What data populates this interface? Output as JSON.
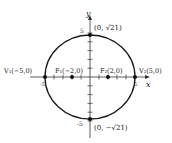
{
  "diagram": {
    "type": "ellipse",
    "axes": {
      "x_label": "x",
      "y_label": "y"
    },
    "ticks": {
      "x_neg": "-5",
      "x_pos": "5",
      "y_pos": "5",
      "y_neg": "-5"
    },
    "points": {
      "v1": {
        "label": "V₁(−5,0)",
        "x": -5,
        "y": 0
      },
      "f1": {
        "label": "F₁(−2,0)",
        "x": -2,
        "y": 0
      },
      "f2": {
        "label": "F₂(2,0)",
        "x": 2,
        "y": 0
      },
      "v2": {
        "label": "V₂(5,0)",
        "x": 5,
        "y": 0
      },
      "top": {
        "label": "(0, √21)",
        "x": 0,
        "y": 4.583
      },
      "bottom": {
        "label": "(0, −√21)",
        "x": 0,
        "y": -4.583
      }
    },
    "colors": {
      "stroke": "#1a1a1a",
      "text": "#222222"
    }
  }
}
